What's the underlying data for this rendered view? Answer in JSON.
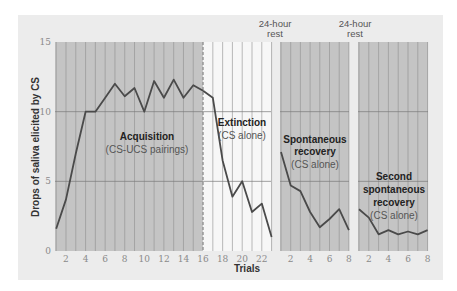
{
  "chart_data": {
    "type": "line",
    "title": "",
    "ylabel": "Drops of saliva elicited by CS",
    "xlabel": "Trials",
    "ylim": [
      0,
      15
    ],
    "yticks": [
      0,
      5,
      10,
      15
    ],
    "grid": true,
    "panels": [
      {
        "name": "Acquisition + Extinction",
        "x_range": [
          1,
          23
        ],
        "xticks": [
          2,
          4,
          6,
          8,
          10,
          12,
          14,
          16,
          18,
          20,
          22
        ],
        "series": [
          {
            "name": "Acquisition",
            "x": [
              1,
              2,
              3,
              4,
              5,
              6,
              7,
              8,
              9,
              10,
              11,
              12,
              13,
              14,
              15,
              16
            ],
            "values": [
              1.6,
              3.7,
              7,
              10,
              10,
              11,
              12,
              11.1,
              11.7,
              10,
              12.2,
              11,
              12.3,
              11,
              11.9,
              11.5
            ]
          },
          {
            "name": "Extinction",
            "x": [
              16,
              17,
              18,
              19,
              20,
              21,
              22,
              23
            ],
            "values": [
              11.5,
              11,
              6.5,
              3.9,
              5,
              2.8,
              3.4,
              1
            ]
          }
        ]
      },
      {
        "name": "Spontaneous recovery",
        "x_range": [
          1,
          8
        ],
        "xticks": [
          2,
          4,
          6,
          8
        ],
        "series": [
          {
            "name": "Spontaneous recovery",
            "x": [
              1,
              2,
              3,
              4,
              5,
              6,
              7,
              8
            ],
            "values": [
              7.1,
              4.7,
              4.3,
              2.8,
              1.7,
              2.3,
              3,
              1.5
            ]
          }
        ]
      },
      {
        "name": "Second spontaneous recovery",
        "x_range": [
          1,
          8
        ],
        "xticks": [
          2,
          4,
          6,
          8
        ],
        "series": [
          {
            "name": "Second spontaneous recovery",
            "x": [
              1,
              2,
              3,
              4,
              5,
              6,
              7,
              8
            ],
            "values": [
              3,
              2.4,
              1.2,
              1.5,
              1.2,
              1.4,
              1.2,
              1.5
            ]
          }
        ]
      }
    ],
    "annotations": [
      {
        "lines": [
          "Acquisition",
          "(CS-UCS pairings)"
        ]
      },
      {
        "lines": [
          "Extinction",
          "(CS alone)"
        ]
      },
      {
        "lines": [
          "Spontaneous",
          "recovery",
          "(CS alone)"
        ]
      },
      {
        "lines": [
          "Second",
          "spontaneous",
          "recovery",
          "(CS alone)"
        ]
      },
      {
        "lines": [
          "24-hour",
          "rest"
        ]
      },
      {
        "lines": [
          "24-hour",
          "rest"
        ]
      }
    ]
  },
  "labels": {
    "ylabel": "Drops of saliva elicited by CS",
    "xlabel": "Trials",
    "acq_title": "Acquisition",
    "acq_sub": "(CS-UCS pairings)",
    "ext_title": "Extinction",
    "ext_sub": "(CS alone)",
    "sr_l1": "Spontaneous",
    "sr_l2": "recovery",
    "sr_sub": "(CS alone)",
    "sr2_l1": "Second",
    "sr2_l2": "spontaneous",
    "sr2_l3": "recovery",
    "sr2_sub": "(CS alone)",
    "rest1_l1": "24-hour",
    "rest1_l2": "rest",
    "rest2_l1": "24-hour",
    "rest2_l2": "rest"
  },
  "colors": {
    "background": "#ececec",
    "shaded": "#c4c4c4",
    "unshaded": "#f7f7f7",
    "gridline": "#8f8f8f",
    "line": "#4a4a4a"
  }
}
